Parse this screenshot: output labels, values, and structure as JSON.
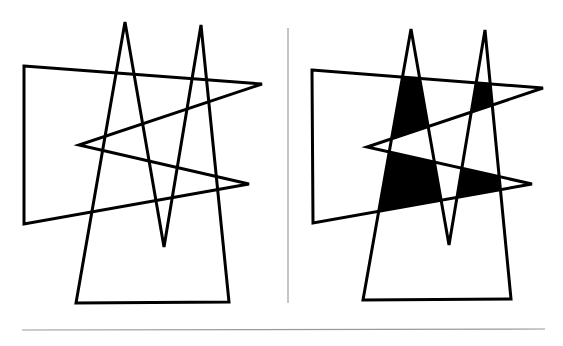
{
  "figure": {
    "panels": [
      {
        "name": "left",
        "shaded": false
      },
      {
        "name": "right",
        "shaded": true
      }
    ],
    "colors": {
      "stroke": "#000000",
      "fill": "#000000",
      "background": "#ffffff",
      "divider": "#8a8a8a",
      "rule": "#9a9a9a"
    }
  }
}
